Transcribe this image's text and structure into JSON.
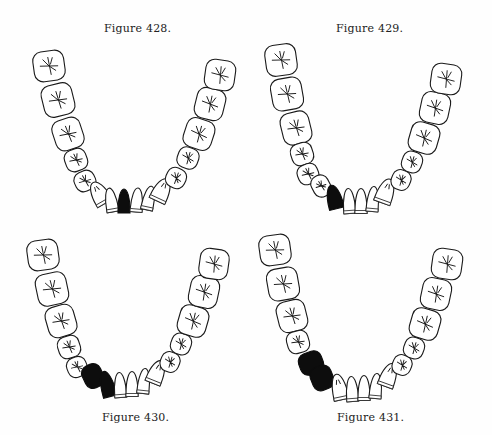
{
  "page": {
    "figures": [
      {
        "id": "fig428",
        "caption": "Figure 428.",
        "caption_pos": {
          "x": 104,
          "y": 22
        },
        "highlighted": [
          "central incisor (left of midline)"
        ],
        "teeth": [
          {
            "type": "molar",
            "cx": 49,
            "cy": 66,
            "w": 31,
            "h": 30,
            "rot": -8
          },
          {
            "type": "molar",
            "cx": 58,
            "cy": 100,
            "w": 31,
            "h": 32,
            "rot": -14
          },
          {
            "type": "molar",
            "cx": 68,
            "cy": 134,
            "w": 29,
            "h": 31,
            "rot": -18
          },
          {
            "type": "premolar",
            "cx": 76,
            "cy": 160,
            "w": 22,
            "h": 22,
            "rot": -20
          },
          {
            "type": "premolar",
            "cx": 85,
            "cy": 181,
            "w": 21,
            "h": 20,
            "rot": -25
          },
          {
            "type": "canine",
            "cx": 99,
            "cy": 193,
            "w": 17,
            "h": 24,
            "rot": -30
          },
          {
            "type": "incisor",
            "cx": 111,
            "cy": 200,
            "w": 12,
            "h": 24,
            "rot": -10
          },
          {
            "type": "incisor",
            "cx": 124,
            "cy": 201,
            "w": 12,
            "h": 24,
            "rot": 0,
            "missing": true
          },
          {
            "type": "incisor",
            "cx": 137,
            "cy": 200,
            "w": 12,
            "h": 24,
            "rot": 5
          },
          {
            "type": "incisor",
            "cx": 149,
            "cy": 198,
            "w": 12,
            "h": 24,
            "rot": 12
          },
          {
            "type": "canine",
            "cx": 162,
            "cy": 190,
            "w": 17,
            "h": 24,
            "rot": 25
          },
          {
            "type": "premolar",
            "cx": 176,
            "cy": 178,
            "w": 20,
            "h": 20,
            "rot": 25
          },
          {
            "type": "premolar",
            "cx": 188,
            "cy": 158,
            "w": 21,
            "h": 21,
            "rot": 20
          },
          {
            "type": "molar",
            "cx": 199,
            "cy": 134,
            "w": 29,
            "h": 30,
            "rot": 18
          },
          {
            "type": "molar",
            "cx": 210,
            "cy": 104,
            "w": 29,
            "h": 31,
            "rot": 14
          },
          {
            "type": "molar",
            "cx": 220,
            "cy": 75,
            "w": 30,
            "h": 30,
            "rot": 8
          }
        ]
      },
      {
        "id": "fig429",
        "caption": "Figure 429.",
        "caption_pos": {
          "x": 336,
          "y": 22
        },
        "highlighted": [
          "canine (left side)"
        ],
        "teeth": [
          {
            "type": "molar",
            "cx": 281,
            "cy": 60,
            "w": 31,
            "h": 31,
            "rot": -8
          },
          {
            "type": "molar",
            "cx": 287,
            "cy": 94,
            "w": 31,
            "h": 32,
            "rot": -10
          },
          {
            "type": "molar",
            "cx": 296,
            "cy": 128,
            "w": 29,
            "h": 32,
            "rot": -14
          },
          {
            "type": "premolar",
            "cx": 302,
            "cy": 154,
            "w": 22,
            "h": 22,
            "rot": -18
          },
          {
            "type": "premolar",
            "cx": 308,
            "cy": 174,
            "w": 21,
            "h": 20,
            "rot": -22
          },
          {
            "type": "premolar",
            "cx": 321,
            "cy": 186,
            "w": 18,
            "h": 22,
            "rot": -28
          },
          {
            "type": "canine",
            "cx": 334,
            "cy": 197,
            "w": 15,
            "h": 24,
            "rot": -14,
            "missing": true
          },
          {
            "type": "incisor",
            "cx": 349,
            "cy": 201,
            "w": 12,
            "h": 25,
            "rot": -4
          },
          {
            "type": "incisor",
            "cx": 361,
            "cy": 201,
            "w": 12,
            "h": 25,
            "rot": 0
          },
          {
            "type": "incisor",
            "cx": 373,
            "cy": 199,
            "w": 12,
            "h": 25,
            "rot": 5
          },
          {
            "type": "canine",
            "cx": 386,
            "cy": 191,
            "w": 17,
            "h": 25,
            "rot": 20
          },
          {
            "type": "premolar",
            "cx": 401,
            "cy": 180,
            "w": 19,
            "h": 20,
            "rot": 22
          },
          {
            "type": "premolar",
            "cx": 412,
            "cy": 162,
            "w": 20,
            "h": 21,
            "rot": 20
          },
          {
            "type": "molar",
            "cx": 424,
            "cy": 138,
            "w": 29,
            "h": 30,
            "rot": 16
          },
          {
            "type": "molar",
            "cx": 435,
            "cy": 108,
            "w": 29,
            "h": 31,
            "rot": 12
          },
          {
            "type": "molar",
            "cx": 446,
            "cy": 79,
            "w": 30,
            "h": 30,
            "rot": 8
          }
        ]
      },
      {
        "id": "fig430",
        "caption": "Figure 430.",
        "caption_pos": {
          "x": 102,
          "y": 411
        },
        "highlighted": [
          "first premolar (left side)",
          "canine (left side)"
        ],
        "teeth": [
          {
            "type": "molar",
            "cx": 43,
            "cy": 255,
            "w": 31,
            "h": 30,
            "rot": -8
          },
          {
            "type": "molar",
            "cx": 52,
            "cy": 289,
            "w": 31,
            "h": 32,
            "rot": -12
          },
          {
            "type": "molar",
            "cx": 61,
            "cy": 321,
            "w": 29,
            "h": 31,
            "rot": -16
          },
          {
            "type": "premolar",
            "cx": 69,
            "cy": 347,
            "w": 22,
            "h": 22,
            "rot": -18
          },
          {
            "type": "premolar",
            "cx": 77,
            "cy": 367,
            "w": 20,
            "h": 20,
            "rot": -22
          },
          {
            "type": "premolar",
            "cx": 93,
            "cy": 376,
            "w": 20,
            "h": 24,
            "rot": -25,
            "missing": true
          },
          {
            "type": "canine",
            "cx": 107,
            "cy": 384,
            "w": 14,
            "h": 26,
            "rot": -15,
            "missing": true
          },
          {
            "type": "incisor",
            "cx": 120,
            "cy": 385,
            "w": 12,
            "h": 25,
            "rot": -4
          },
          {
            "type": "incisor",
            "cx": 132,
            "cy": 384,
            "w": 12,
            "h": 25,
            "rot": 0
          },
          {
            "type": "incisor",
            "cx": 144,
            "cy": 381,
            "w": 12,
            "h": 25,
            "rot": 6
          },
          {
            "type": "canine",
            "cx": 157,
            "cy": 372,
            "w": 16,
            "h": 24,
            "rot": 22
          },
          {
            "type": "premolar",
            "cx": 170,
            "cy": 362,
            "w": 19,
            "h": 20,
            "rot": 22
          },
          {
            "type": "premolar",
            "cx": 181,
            "cy": 344,
            "w": 20,
            "h": 21,
            "rot": 20
          },
          {
            "type": "molar",
            "cx": 193,
            "cy": 321,
            "w": 29,
            "h": 30,
            "rot": 16
          },
          {
            "type": "molar",
            "cx": 204,
            "cy": 292,
            "w": 29,
            "h": 31,
            "rot": 12
          },
          {
            "type": "molar",
            "cx": 214,
            "cy": 264,
            "w": 29,
            "h": 30,
            "rot": 8
          }
        ]
      },
      {
        "id": "fig431",
        "caption": "Figure 431.",
        "caption_pos": {
          "x": 337,
          "y": 411
        },
        "highlighted": [
          "first premolar (left side)",
          "second premolar (left side)"
        ],
        "teeth": [
          {
            "type": "molar",
            "cx": 275,
            "cy": 250,
            "w": 31,
            "h": 30,
            "rot": -8
          },
          {
            "type": "molar",
            "cx": 283,
            "cy": 284,
            "w": 31,
            "h": 32,
            "rot": -10
          },
          {
            "type": "molar",
            "cx": 292,
            "cy": 316,
            "w": 29,
            "h": 31,
            "rot": -14
          },
          {
            "type": "premolar",
            "cx": 298,
            "cy": 342,
            "w": 22,
            "h": 22,
            "rot": -16
          },
          {
            "type": "premolar",
            "cx": 311,
            "cy": 363,
            "w": 24,
            "h": 22,
            "rot": -20,
            "missing": true
          },
          {
            "type": "premolar",
            "cx": 322,
            "cy": 378,
            "w": 22,
            "h": 24,
            "rot": -22,
            "missing": true
          },
          {
            "type": "canine",
            "cx": 339,
            "cy": 387,
            "w": 15,
            "h": 26,
            "rot": -12
          },
          {
            "type": "incisor",
            "cx": 352,
            "cy": 389,
            "w": 12,
            "h": 25,
            "rot": -4
          },
          {
            "type": "incisor",
            "cx": 364,
            "cy": 388,
            "w": 12,
            "h": 25,
            "rot": 0
          },
          {
            "type": "incisor",
            "cx": 376,
            "cy": 386,
            "w": 12,
            "h": 25,
            "rot": 5
          },
          {
            "type": "canine",
            "cx": 389,
            "cy": 375,
            "w": 16,
            "h": 24,
            "rot": 20
          },
          {
            "type": "premolar",
            "cx": 402,
            "cy": 365,
            "w": 19,
            "h": 20,
            "rot": 22
          },
          {
            "type": "premolar",
            "cx": 414,
            "cy": 348,
            "w": 20,
            "h": 21,
            "rot": 20
          },
          {
            "type": "molar",
            "cx": 425,
            "cy": 324,
            "w": 29,
            "h": 30,
            "rot": 16
          },
          {
            "type": "molar",
            "cx": 436,
            "cy": 294,
            "w": 29,
            "h": 31,
            "rot": 12
          },
          {
            "type": "molar",
            "cx": 447,
            "cy": 264,
            "w": 30,
            "h": 30,
            "rot": 8
          }
        ]
      }
    ]
  }
}
